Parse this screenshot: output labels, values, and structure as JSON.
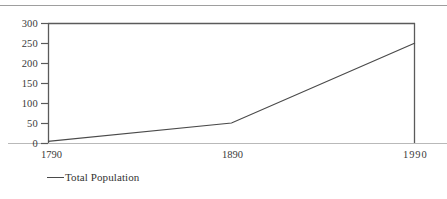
{
  "chart_data": {
    "type": "line",
    "title": "",
    "subtitle": "",
    "xlabel": "",
    "ylabel": "",
    "x": [
      1790,
      1890,
      1990
    ],
    "categories": [
      "1790",
      "1890",
      "1990"
    ],
    "series": [
      {
        "name": "Total Population",
        "values": [
          4,
          50,
          250
        ]
      }
    ],
    "xlim": [
      1790,
      1990
    ],
    "ylim": [
      0,
      300
    ],
    "ytick_values": [
      300,
      250,
      200,
      150,
      100,
      50,
      0
    ],
    "ytick_labels": [
      "300",
      "250",
      "200",
      "150",
      "100",
      "50",
      "0"
    ],
    "xtick_values": [
      1790,
      1890,
      1990
    ],
    "xtick_labels": [
      "1790",
      "1890",
      "1990"
    ],
    "grid": false,
    "legend_position": "below-left",
    "legend": [
      {
        "label": "Total Population",
        "marker": "line-dash",
        "color": "#4a4a4a"
      }
    ],
    "annotations": []
  },
  "colors": {
    "series_line": "#4a4a4a",
    "frame": "#5a5a5a",
    "baseline": "#b9b9b9",
    "tick": "#5a5a5a",
    "text": "#3a3a3a",
    "top_rule": "#8d8d8d",
    "background": "#ffffff"
  },
  "axes": {
    "y_labels": [
      {
        "text": "300",
        "top": 19
      },
      {
        "text": "250",
        "top": 39
      },
      {
        "text": "200",
        "top": 59
      },
      {
        "text": "150",
        "top": 79
      },
      {
        "text": "100",
        "top": 99
      },
      {
        "text": "50",
        "top": 119
      },
      {
        "text": "0",
        "top": 139
      }
    ],
    "x_labels": [
      {
        "text": "1790",
        "left": 41,
        "top": 150
      },
      {
        "text": "1890",
        "left": 222,
        "top": 150
      },
      {
        "text": "1990",
        "left": 403,
        "top": 150
      }
    ]
  }
}
